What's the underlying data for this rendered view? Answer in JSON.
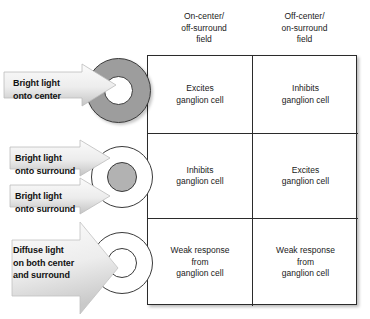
{
  "diagram": {
    "colors": {
      "field_dark_gray": "#9d9d9d",
      "field_mid_gray": "#b2b2b2",
      "field_white": "#ffffff",
      "outline": "#3a3a3a",
      "arrow_light": "#f2f2f2",
      "arrow_dark": "#c9c9c9",
      "table_border": "#2b2b2b",
      "text": "#1a1a1a"
    },
    "columns": [
      {
        "id": "on-center-off-surround",
        "label": "On-center/\noff-surround\nfield"
      },
      {
        "id": "off-center-on-surround",
        "label": "Off-center/\non-surround\nfield"
      }
    ],
    "rows": [
      {
        "id": "bright-light-onto-center",
        "stimulus_labels": [
          "Bright light\nonto center"
        ],
        "field": {
          "surround_fill": "#9d9d9d",
          "center_fill": "#ffffff"
        },
        "cells": [
          "Excites\nganglion cell",
          "Inhibits\nganglion cell"
        ]
      },
      {
        "id": "bright-light-onto-surround",
        "stimulus_labels": [
          "Bright light\nonto surround",
          "Bright light\nonto surround"
        ],
        "field": {
          "surround_fill": "#ffffff",
          "center_fill": "#b2b2b2"
        },
        "cells": [
          "Inhibits\nganglion cell",
          "Excites\nganglion cell"
        ]
      },
      {
        "id": "diffuse-light-both",
        "stimulus_labels": [
          "Diffuse light\non both center\nand surround"
        ],
        "field": {
          "surround_fill": "#ffffff",
          "center_fill": "#ffffff"
        },
        "cells": [
          "Weak response\nfrom\nganglion cell",
          "Weak response\nfrom\nganglion cell"
        ]
      }
    ]
  }
}
